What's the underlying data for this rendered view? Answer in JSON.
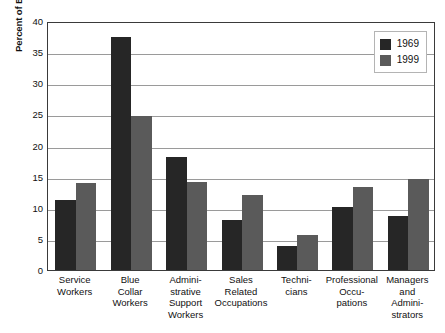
{
  "chart_data": {
    "type": "bar",
    "title": "",
    "xlabel": "",
    "ylabel": "Percent of Employed Adults",
    "ylim": [
      0,
      40
    ],
    "ytick_step": 5,
    "yticks": [
      "0",
      "5",
      "10",
      "15",
      "20",
      "25",
      "30",
      "35",
      "40"
    ],
    "grid": "horizontal",
    "legend_position": "top-right-inside",
    "categories": [
      "Service\nWorkers",
      "Blue\nCollar\nWorkers",
      "Admini-\nstrative\nSupport\nWorkers",
      "Sales\nRelated\nOccupations",
      "Techni-\ncians",
      "Professional\nOccu-\npations",
      "Managers\nand\nAdmini-\nstrators"
    ],
    "series": [
      {
        "name": "1969",
        "color": "#262626",
        "values": [
          11.3,
          37.5,
          18.1,
          8.0,
          3.8,
          10.2,
          8.7
        ]
      },
      {
        "name": "1999",
        "color": "#5a5a5a",
        "values": [
          14.0,
          24.8,
          14.1,
          12.0,
          5.6,
          13.4,
          14.6
        ]
      }
    ]
  },
  "legend": {
    "items": [
      {
        "label": "1969",
        "color": "#262626"
      },
      {
        "label": "1999",
        "color": "#5a5a5a"
      }
    ]
  },
  "axis": {
    "y_title": "Percent of Employed Adults"
  }
}
